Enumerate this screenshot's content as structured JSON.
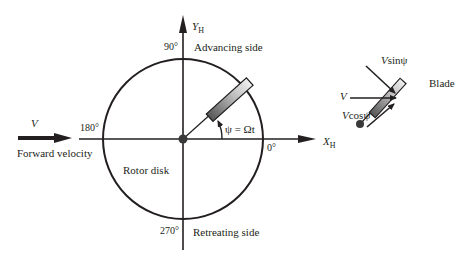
{
  "diagram": {
    "axes": {
      "x_label": "X",
      "x_sub": "H",
      "y_label": "Y",
      "y_sub": "H"
    },
    "angles": {
      "a0": "0°",
      "a90": "90°",
      "a180": "180°",
      "a270": "270°"
    },
    "regions": {
      "advancing": "Advancing side",
      "retreating": "Retreating side",
      "disk": "Rotor disk"
    },
    "azimuth_label": "ψ = Ωt",
    "velocity": {
      "symbol": "V",
      "label": "Forward velocity"
    },
    "inset": {
      "v": "V",
      "vsin_v": "V",
      "vsin_rest": "sinψ",
      "vcos_v": "V",
      "vcos_rest": "cosψ",
      "blade": "Blade"
    },
    "colors": {
      "line": "#231f20",
      "blade_dark": "#4a4a4a",
      "blade_light": "#e8e8e8"
    }
  }
}
